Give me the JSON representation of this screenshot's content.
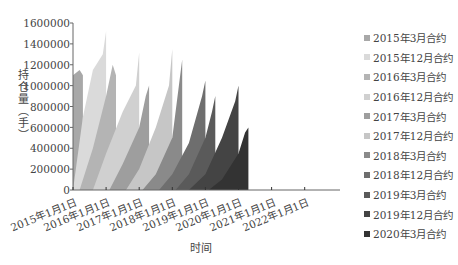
{
  "chart_data": {
    "type": "area",
    "title": "",
    "xlabel": "时间",
    "ylabel": "持仓量（手）",
    "ylim": [
      0,
      1600000
    ],
    "yticks": [
      "0",
      "200000",
      "400000",
      "600000",
      "800000",
      "1000000",
      "1200000",
      "1400000",
      "1600000"
    ],
    "xticks": [
      "2015年1月1日",
      "2016年1月1日",
      "2017年1月1日",
      "2018年1月1日",
      "2019年1月1日",
      "2020年1月1日",
      "2021年1月1日",
      "2022年1月1日"
    ],
    "grid": false,
    "legend_position": "right",
    "series": [
      {
        "name": "2015年3月合约",
        "color": "#a8a8a8",
        "x": [
          2015.0,
          2015.2,
          2015.3
        ],
        "values": [
          1100000,
          1150000,
          1100000
        ]
      },
      {
        "name": "2015年12月合约",
        "color": "#dadada",
        "x": [
          2015.0,
          2015.3,
          2015.6,
          2015.9,
          2016.0
        ],
        "values": [
          0,
          700000,
          1150000,
          1300000,
          1520000
        ]
      },
      {
        "name": "2016年3月合约",
        "color": "#b4b4b4",
        "x": [
          2015.2,
          2015.6,
          2016.0,
          2016.2,
          2016.3
        ],
        "values": [
          0,
          400000,
          900000,
          1200000,
          1100000
        ]
      },
      {
        "name": "2016年12月合约",
        "color": "#d0d0d0",
        "x": [
          2015.6,
          2016.0,
          2016.5,
          2016.9,
          2017.0
        ],
        "values": [
          0,
          350000,
          750000,
          1000000,
          1320000
        ]
      },
      {
        "name": "2017年3月合约",
        "color": "#9e9e9e",
        "x": [
          2016.1,
          2016.5,
          2017.0,
          2017.2,
          2017.3
        ],
        "values": [
          0,
          250000,
          600000,
          900000,
          1000000
        ]
      },
      {
        "name": "2017年12月合约",
        "color": "#c6c6c6",
        "x": [
          2016.6,
          2017.0,
          2017.5,
          2017.9,
          2018.0
        ],
        "values": [
          0,
          200000,
          600000,
          1000000,
          1350000
        ]
      },
      {
        "name": "2018年3月合约",
        "color": "#8a8a8a",
        "x": [
          2017.1,
          2017.5,
          2018.0,
          2018.2,
          2018.3
        ],
        "values": [
          0,
          150000,
          500000,
          1000000,
          1250000
        ]
      },
      {
        "name": "2018年12月合约",
        "color": "#6e6e6e",
        "x": [
          2017.6,
          2018.0,
          2018.5,
          2018.9,
          2019.0
        ],
        "values": [
          0,
          150000,
          450000,
          900000,
          1050000
        ]
      },
      {
        "name": "2019年3月合约",
        "color": "#5a5a5a",
        "x": [
          2018.1,
          2018.5,
          2019.0,
          2019.2,
          2019.3
        ],
        "values": [
          0,
          150000,
          500000,
          750000,
          900000
        ]
      },
      {
        "name": "2019年12月合约",
        "color": "#444444",
        "x": [
          2018.5,
          2019.0,
          2019.5,
          2019.9,
          2020.0
        ],
        "values": [
          0,
          150000,
          500000,
          850000,
          1000000
        ]
      },
      {
        "name": "2020年3月合约",
        "color": "#333333",
        "x": [
          2019.1,
          2019.5,
          2020.0,
          2020.2,
          2020.3
        ],
        "values": [
          0,
          100000,
          350000,
          550000,
          600000
        ]
      }
    ]
  },
  "legend": [
    {
      "label": "2015年3月合约",
      "color": "#a8a8a8"
    },
    {
      "label": "2015年12月合约",
      "color": "#dadada"
    },
    {
      "label": "2016年3月合约",
      "color": "#b4b4b4"
    },
    {
      "label": "2016年12月合约",
      "color": "#d0d0d0"
    },
    {
      "label": "2017年3月合约",
      "color": "#9e9e9e"
    },
    {
      "label": "2017年12月合约",
      "color": "#c6c6c6"
    },
    {
      "label": "2018年3月合约",
      "color": "#8a8a8a"
    },
    {
      "label": "2018年12月合约",
      "color": "#6e6e6e"
    },
    {
      "label": "2019年3月合约",
      "color": "#5a5a5a"
    },
    {
      "label": "2019年12月合约",
      "color": "#444444"
    },
    {
      "label": "2020年3月合约",
      "color": "#333333"
    }
  ],
  "axis": {
    "ylabel": "持仓量（手）",
    "xlabel": "时间",
    "yticks": [
      "1600000",
      "1400000",
      "1200000",
      "1000000",
      "800000",
      "600000",
      "400000",
      "200000",
      "0"
    ],
    "xticks": [
      "2015年1月1日",
      "2016年1月1日",
      "2017年1月1日",
      "2018年1月1日",
      "2019年1月1日",
      "2020年1月1日",
      "2021年1月1日",
      "2022年1月1日"
    ]
  }
}
